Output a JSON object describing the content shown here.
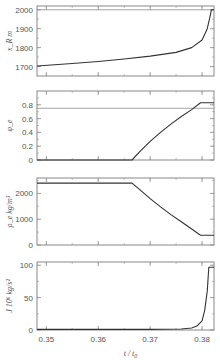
{
  "chart_data": [
    {
      "type": "line",
      "panel": 1,
      "ylabel": "x_R",
      "yunit": "m",
      "ylim": [
        1650,
        2020
      ],
      "yticks": [
        1700,
        1800,
        1900,
        2000
      ],
      "reference_line": 2000,
      "x": [
        0.3482,
        0.355,
        0.36,
        0.365,
        0.37,
        0.375,
        0.378,
        0.38,
        0.381,
        0.3815,
        0.3818,
        0.3823
      ],
      "values": [
        1703,
        1716,
        1727,
        1740,
        1755,
        1775,
        1800,
        1840,
        1900,
        1960,
        2000,
        2000
      ]
    },
    {
      "type": "line",
      "panel": 2,
      "ylabel": "φ_e",
      "yunit": "",
      "ylim": [
        0,
        1.0
      ],
      "yticks": [
        0,
        0.2,
        0.4,
        0.6,
        0.8
      ],
      "yticklabels": [
        "0",
        "0.2",
        "0.4",
        "0.6",
        "0.8"
      ],
      "reference_line": 0.75,
      "x": [
        0.3482,
        0.3665,
        0.368,
        0.37,
        0.372,
        0.374,
        0.376,
        0.378,
        0.3797,
        0.3823
      ],
      "values": [
        0,
        0,
        0.12,
        0.27,
        0.4,
        0.52,
        0.63,
        0.73,
        0.83,
        0.83
      ]
    },
    {
      "type": "line",
      "panel": 3,
      "ylabel": "ρ_e",
      "yunit": "kg/m³",
      "ylim": [
        0,
        2600
      ],
      "yticks": [
        0,
        1000,
        2000
      ],
      "x": [
        0.3482,
        0.3665,
        0.368,
        0.37,
        0.372,
        0.374,
        0.376,
        0.378,
        0.3797,
        0.3823
      ],
      "values": [
        2400,
        2400,
        2150,
        1800,
        1480,
        1180,
        900,
        620,
        380,
        380
      ]
    },
    {
      "type": "line",
      "panel": 4,
      "ylabel": "J",
      "yunit": "10⁶ kg/s²",
      "ylim": [
        0,
        105
      ],
      "yticks": [
        0,
        50,
        100
      ],
      "x": [
        0.3482,
        0.37,
        0.376,
        0.378,
        0.379,
        0.38,
        0.3805,
        0.381,
        0.3813,
        0.3823
      ],
      "values": [
        1,
        1,
        1.5,
        3,
        6,
        14,
        30,
        60,
        97,
        97
      ]
    }
  ],
  "xaxis": {
    "label_t": "t",
    "label_sep": "/",
    "label_t0": "t",
    "label_t0_sub": "0",
    "xlim": [
      0.3482,
      0.3823
    ],
    "xticks": [
      0.35,
      0.36,
      0.37,
      0.38
    ],
    "xticklabels": [
      "0.35",
      "0.36",
      "0.37",
      "0.38"
    ]
  }
}
